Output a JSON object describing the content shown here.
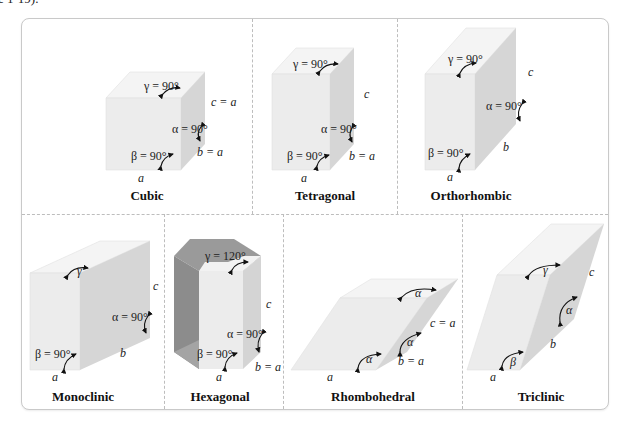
{
  "caption_fragment": "e 1-19).",
  "colors": {
    "face_front": "#ececec",
    "face_top": "#f4f4f4",
    "face_side": "#d6d6d6",
    "hex_dark": "#8c8c8c",
    "hex_mid": "#a8a8a8",
    "divider": "#bdbdbd",
    "border": "#c9c9c9"
  },
  "systems": [
    {
      "name": "Cubic",
      "gamma": "γ = 90°",
      "alpha": "α = 90°",
      "beta": "β = 90°",
      "a": "a",
      "b": "b = a",
      "c": "c = a"
    },
    {
      "name": "Tetragonal",
      "gamma": "γ = 90°",
      "alpha": "α = 90°",
      "beta": "β = 90°",
      "a": "a",
      "b": "b = a",
      "c": "c"
    },
    {
      "name": "Orthorhombic",
      "gamma": "γ = 90°",
      "alpha": "α = 90°",
      "beta": "β = 90°",
      "a": "a",
      "b": "b",
      "c": "c"
    },
    {
      "name": "Monoclinic",
      "gamma": "γ",
      "alpha": "α = 90°",
      "beta": "β = 90°",
      "a": "a",
      "b": "b",
      "c": "c"
    },
    {
      "name": "Hexagonal",
      "gamma": "γ = 120°",
      "alpha": "α = 90°",
      "beta": "β = 90°",
      "a": "a",
      "b": "b = a",
      "c": "c"
    },
    {
      "name": "Rhombohedral",
      "gamma": "α",
      "alpha": "α",
      "beta": "α",
      "a": "a",
      "b": "b = a",
      "c": "c = a"
    },
    {
      "name": "Triclinic",
      "gamma": "γ",
      "alpha": "α",
      "beta": "β",
      "a": "a",
      "b": "b",
      "c": "c"
    }
  ]
}
